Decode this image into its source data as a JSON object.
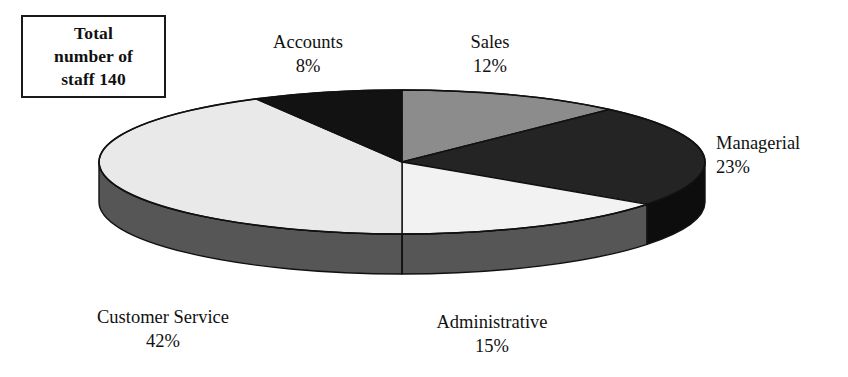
{
  "callout": {
    "name": "total-staff-callout",
    "line1": "Total",
    "line2": "number of",
    "line3": "staff 140",
    "total_staff": 140
  },
  "chart_data": {
    "type": "pie",
    "title": "",
    "subtitle": "",
    "xlabel": "",
    "ylabel": "",
    "legend_position": "none",
    "grid": false,
    "style": "3d-exploded-disc",
    "value_unit": "percent",
    "total_label": "Total number of staff 140",
    "total_value": 140,
    "categories": [
      "Sales",
      "Managerial",
      "Administrative",
      "Customer Service",
      "Accounts"
    ],
    "values": [
      12,
      23,
      15,
      42,
      8
    ],
    "labels": [
      "12%",
      "23%",
      "15%",
      "42%",
      "8%"
    ],
    "colors": [
      "#8c8c8c",
      "#242424",
      "#f2f2f2",
      "#e9e9e9",
      "#121212"
    ],
    "side_colors": [
      "#565656",
      "#0d0d0d",
      "#565656",
      "#565656",
      "#0d0d0d"
    ],
    "slices": [
      {
        "name": "Sales",
        "value": 12,
        "label": "12%",
        "color": "#8c8c8c",
        "side_color": "#565656",
        "start_pct": 0,
        "end_pct": 12,
        "label_name": "Sales",
        "label_pct": "12%"
      },
      {
        "name": "Managerial",
        "value": 23,
        "label": "23%",
        "color": "#242424",
        "side_color": "#0d0d0d",
        "start_pct": 12,
        "end_pct": 35,
        "label_name": "Managerial",
        "label_pct": "23%"
      },
      {
        "name": "Administrative",
        "value": 15,
        "label": "15%",
        "color": "#f2f2f2",
        "side_color": "#565656",
        "start_pct": 35,
        "end_pct": 50,
        "label_name": "Administrative",
        "label_pct": "15%"
      },
      {
        "name": "Customer Service",
        "value": 42,
        "label": "42%",
        "color": "#e9e9e9",
        "side_color": "#565656",
        "start_pct": 50,
        "end_pct": 92,
        "label_name": "Customer Service",
        "label_pct": "42%"
      },
      {
        "name": "Accounts",
        "value": 8,
        "label": "8%",
        "color": "#121212",
        "side_color": "#0d0d0d",
        "start_pct": 92,
        "end_pct": 100,
        "label_name": "Accounts",
        "label_pct": "8%"
      }
    ],
    "geometry": {
      "cx": 402,
      "cy": 162,
      "rx": 303,
      "ry": 72,
      "depth": 40,
      "outline_color": "#111111"
    }
  }
}
